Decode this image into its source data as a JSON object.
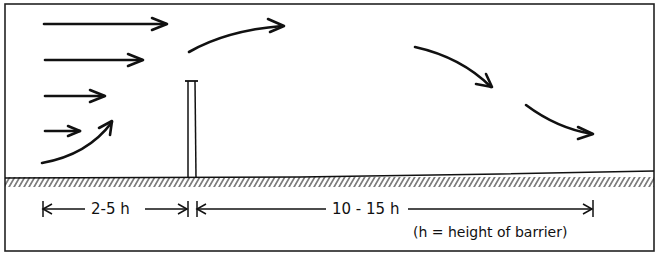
{
  "diagram": {
    "labels": {
      "upwind_zone": "2-5 h",
      "downwind_zone": "10 - 15 h",
      "legend_note": "(h = height of barrier)"
    },
    "elements": {
      "barrier": "vertical barrier (height h)",
      "ground": "hatched ground surface",
      "wind_arrows": [
        "upwind straight arrow 1",
        "upwind straight arrow 2",
        "upwind straight arrow 3",
        "upwind straight arrow 4",
        "upwind rising arrow",
        "arrow rising over barrier",
        "downwind descending arrow 1",
        "downwind descending arrow 2"
      ]
    },
    "colors": {
      "ink": "#111111",
      "background": "#ffffff"
    }
  }
}
